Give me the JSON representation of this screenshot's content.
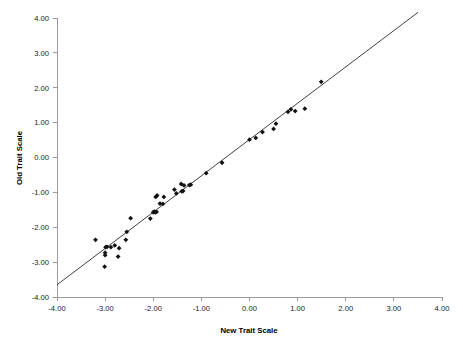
{
  "chart_data": {
    "type": "scatter",
    "title": "",
    "xlabel": "New Trait Scale",
    "ylabel": "Old Trait Scale",
    "xlim": [
      -4.0,
      4.0
    ],
    "ylim": [
      -4.0,
      4.0
    ],
    "grid": false,
    "legend": null,
    "xticks": [
      -4.0,
      -3.0,
      -2.0,
      -1.0,
      0.0,
      1.0,
      2.0,
      3.0,
      4.0
    ],
    "yticks": [
      -4.0,
      -3.0,
      -2.0,
      -1.0,
      0.0,
      1.0,
      2.0,
      3.0,
      4.0
    ],
    "xtick_labels": [
      "-4.00",
      "-3.00",
      "-2.00",
      "-1.00",
      "0.00",
      "1.00",
      "2.00",
      "3.00",
      "4.00"
    ],
    "ytick_labels": [
      "-4.00",
      "-3.00",
      "-2.00",
      "-1.00",
      "0.00",
      "1.00",
      "2.00",
      "3.00",
      "4.00"
    ],
    "marker": "diamond",
    "marker_color": "#111111",
    "series": [
      {
        "name": "Trait scale comparison",
        "points": [
          [
            -3.2,
            -2.36
          ],
          [
            -3.01,
            -3.13
          ],
          [
            -3.0,
            -2.8
          ],
          [
            -3.0,
            -2.73
          ],
          [
            -2.99,
            -2.57
          ],
          [
            -2.96,
            -2.56
          ],
          [
            -2.88,
            -2.57
          ],
          [
            -2.8,
            -2.52
          ],
          [
            -2.73,
            -2.84
          ],
          [
            -2.71,
            -2.6
          ],
          [
            -2.57,
            -2.36
          ],
          [
            -2.55,
            -2.13
          ],
          [
            -2.47,
            -1.74
          ],
          [
            -2.06,
            -1.75
          ],
          [
            -2.0,
            -1.57
          ],
          [
            -1.98,
            -1.55
          ],
          [
            -1.96,
            -1.57
          ],
          [
            -1.95,
            -1.13
          ],
          [
            -1.93,
            -1.56
          ],
          [
            -1.92,
            -1.09
          ],
          [
            -1.86,
            -1.32
          ],
          [
            -1.8,
            -1.33
          ],
          [
            -1.78,
            -1.13
          ],
          [
            -1.56,
            -0.92
          ],
          [
            -1.52,
            -1.03
          ],
          [
            -1.42,
            -0.76
          ],
          [
            -1.41,
            -0.97
          ],
          [
            -1.38,
            -0.96
          ],
          [
            -1.36,
            -0.8
          ],
          [
            -1.25,
            -0.79
          ],
          [
            -1.22,
            -0.78
          ],
          [
            -0.9,
            -0.45
          ],
          [
            -0.57,
            -0.15
          ],
          [
            0.0,
            0.51
          ],
          [
            0.13,
            0.56
          ],
          [
            0.27,
            0.73
          ],
          [
            0.5,
            0.82
          ],
          [
            0.55,
            0.97
          ],
          [
            0.8,
            1.31
          ],
          [
            0.86,
            1.38
          ],
          [
            0.95,
            1.33
          ],
          [
            1.15,
            1.4
          ],
          [
            1.49,
            2.17
          ]
        ]
      }
    ],
    "reference_line": {
      "label": "identity fit line",
      "x1": -4.0,
      "y1": -3.65,
      "x2": 3.5,
      "y2": 4.16
    }
  }
}
